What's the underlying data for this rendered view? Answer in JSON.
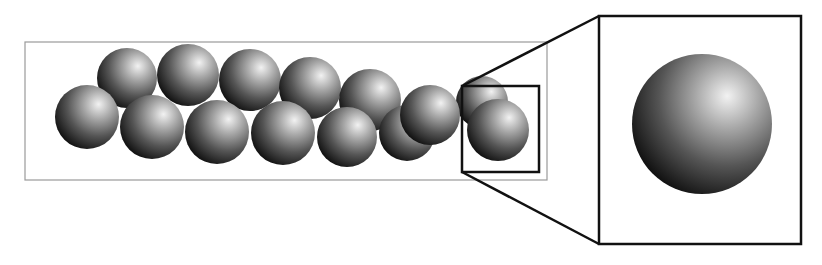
{
  "figure": {
    "colors": {
      "background": "#ffffff",
      "channel_border": "#9a9a9a",
      "zoom_box_border": "#111111",
      "sphere_highlight": "#f2f2f2",
      "sphere_mid": "#7a7a7a",
      "sphere_shadow": "#111111"
    },
    "channel": {
      "x": 25,
      "y": 42,
      "width": 522,
      "height": 138
    },
    "spheres": [
      {
        "cx": 127,
        "cy": 78,
        "r": 30
      },
      {
        "cx": 188,
        "cy": 75,
        "r": 31
      },
      {
        "cx": 250,
        "cy": 80,
        "r": 31
      },
      {
        "cx": 310,
        "cy": 88,
        "r": 31
      },
      {
        "cx": 370,
        "cy": 100,
        "r": 31
      },
      {
        "cx": 482,
        "cy": 102,
        "r": 26
      },
      {
        "cx": 87,
        "cy": 117,
        "r": 32
      },
      {
        "cx": 152,
        "cy": 127,
        "r": 32
      },
      {
        "cx": 217,
        "cy": 132,
        "r": 32
      },
      {
        "cx": 283,
        "cy": 133,
        "r": 32
      },
      {
        "cx": 347,
        "cy": 137,
        "r": 30
      },
      {
        "cx": 407,
        "cy": 133,
        "r": 28
      },
      {
        "cx": 430,
        "cy": 115,
        "r": 30
      },
      {
        "cx": 498,
        "cy": 130,
        "r": 31
      }
    ],
    "zoom_box": {
      "x": 462,
      "y": 86,
      "width": 77,
      "height": 86
    },
    "inset_box": {
      "x": 599,
      "y": 16,
      "width": 202,
      "height": 228
    },
    "inset_sphere": {
      "cx": 702,
      "cy": 124,
      "r": 70
    }
  }
}
